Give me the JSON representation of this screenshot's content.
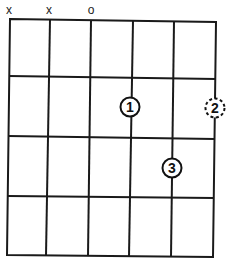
{
  "diagram": {
    "type": "guitar-chord-chart",
    "strings": 6,
    "frets_shown": 4,
    "string_markers": [
      {
        "string": 1,
        "label": "x",
        "meaning": "muted"
      },
      {
        "string": 2,
        "label": "x",
        "meaning": "muted"
      },
      {
        "string": 3,
        "label": "o",
        "meaning": "open"
      },
      {
        "string": 4,
        "label": "",
        "meaning": "none"
      },
      {
        "string": 5,
        "label": "",
        "meaning": "none"
      },
      {
        "string": 6,
        "label": "",
        "meaning": "none"
      }
    ],
    "fingers": [
      {
        "finger": "1",
        "string": 4,
        "fret": 2,
        "style": "solid"
      },
      {
        "finger": "2",
        "string": 6,
        "fret": 2,
        "style": "dashed"
      },
      {
        "finger": "3",
        "string": 5,
        "fret": 3,
        "style": "solid"
      }
    ],
    "colors": {
      "line": "#1a1a1a",
      "background": "#ffffff"
    }
  }
}
